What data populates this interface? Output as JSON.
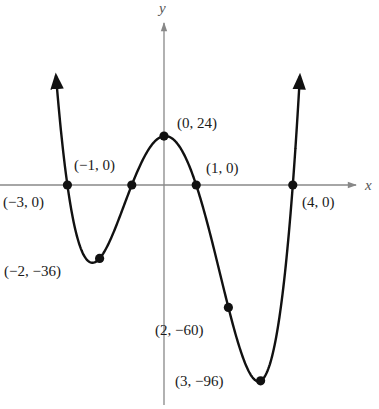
{
  "chart_data": {
    "type": "line",
    "title": "",
    "function": "y = 2(x+3)(x+1)(x-1)(x-4)",
    "xlabel": "x",
    "ylabel": "y",
    "xlim": [
      -4,
      6
    ],
    "ylim": [
      -105,
      70
    ],
    "grid": false,
    "legend": null,
    "points": [
      {
        "x": -3,
        "y": 0,
        "label": "(−3, 0)"
      },
      {
        "x": -2,
        "y": -36,
        "label": "(−2, −36)"
      },
      {
        "x": -1,
        "y": 0,
        "label": "(−1, 0)"
      },
      {
        "x": 0,
        "y": 24,
        "label": "(0, 24)"
      },
      {
        "x": 1,
        "y": 0,
        "label": "(1, 0)"
      },
      {
        "x": 2,
        "y": -60,
        "label": "(2, −60)"
      },
      {
        "x": 3,
        "y": -96,
        "label": "(3, −96)"
      },
      {
        "x": 4,
        "y": 0,
        "label": "(4, 0)"
      }
    ],
    "annotations": [
      "(−3, 0)",
      "(−2, −36)",
      "(−1, 0)",
      "(0, 24)",
      "(1, 0)",
      "(2, −60)",
      "(3, −96)",
      "(4, 0)"
    ]
  },
  "layout": {
    "origin_px": [
      164,
      185
    ],
    "x_scale_px": 32.2,
    "y_scale_px": 2.04,
    "curve_color": "#111111",
    "axis_color": "#888888"
  },
  "labels": {
    "x_axis": "x",
    "y_axis": "y",
    "p_m3": "(−3, 0)",
    "p_m2": "(−2, −36)",
    "p_m1": "(−1, 0)",
    "p_0": "(0, 24)",
    "p_1": "(1, 0)",
    "p_2": "(2, −60)",
    "p_3": "(3, −96)",
    "p_4": "(4, 0)"
  }
}
